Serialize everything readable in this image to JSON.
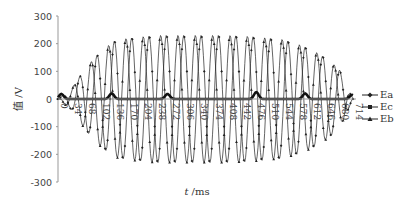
{
  "chart_data": {
    "type": "line",
    "title": "",
    "xlabel_italic": "t",
    "xlabel_unit": " /ms",
    "ylabel": "值 /V",
    "ylim": [
      -300,
      300
    ],
    "xlim": [
      0,
      714
    ],
    "yticks": [
      300,
      200,
      100,
      0,
      -100,
      -200,
      -300
    ],
    "xticks": [
      0,
      34,
      68,
      102,
      136,
      170,
      204,
      238,
      272,
      306,
      340,
      374,
      408,
      442,
      476,
      510,
      544,
      578,
      612,
      646,
      680,
      714
    ],
    "grid": false,
    "legend_position": "right",
    "series": [
      {
        "name": "Ea",
        "marker": "diamond",
        "description": "sinusoidal voltage, amplitude ramps from ~110 V up to ~230 V near 250-500 ms then decreases to ~110 V at 680 ms"
      },
      {
        "name": "Ec",
        "marker": "square",
        "description": "near-zero bold line with small bumps (~15-25 V) around 10, 130, 265, 480, 600, 714 ms"
      },
      {
        "name": "Eb",
        "marker": "triangle",
        "description": "sinusoidal voltage phase-shifted from Ea, amplitude up to ~230 V"
      }
    ],
    "envelope": {
      "t": [
        0,
        34,
        68,
        102,
        136,
        170,
        204,
        238,
        272,
        306,
        340,
        374,
        408,
        442,
        476,
        510,
        544,
        578,
        612,
        646,
        680,
        714
      ],
      "amplitude": [
        0,
        40,
        115,
        170,
        210,
        220,
        225,
        230,
        230,
        230,
        230,
        230,
        230,
        228,
        225,
        220,
        215,
        200,
        180,
        150,
        110,
        0
      ]
    }
  },
  "legend": {
    "items": [
      {
        "label": "Ea"
      },
      {
        "label": "Ec"
      },
      {
        "label": "Eb"
      }
    ]
  }
}
